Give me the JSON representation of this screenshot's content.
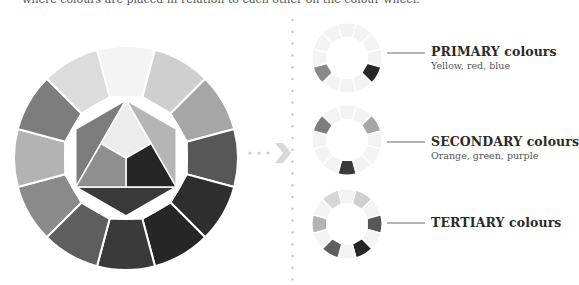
{
  "intro_text": "where colours are placed in relation to each other on the colour wheel.",
  "big_wheel": {
    "center": [
      126,
      158
    ],
    "outer_radius": 112,
    "inner_radius": 63,
    "segments": [
      {
        "position": "top",
        "color": "#f4f4f4"
      },
      {
        "position": "top-right",
        "color": "#cfcfcf"
      },
      {
        "position": "right-upper",
        "color": "#a6a6a6"
      },
      {
        "position": "right",
        "color": "#575757"
      },
      {
        "position": "right-lower",
        "color": "#2e2e2e"
      },
      {
        "position": "bottom-right",
        "color": "#262626"
      },
      {
        "position": "bottom",
        "color": "#3a3a3a"
      },
      {
        "position": "bottom-left",
        "color": "#5e5e5e"
      },
      {
        "position": "left-lower",
        "color": "#8a8a8a"
      },
      {
        "position": "left",
        "color": "#b3b3b3"
      },
      {
        "position": "left-upper",
        "color": "#7d7d7d"
      },
      {
        "position": "top-left",
        "color": "#dcdcdc"
      }
    ],
    "hexagon": {
      "radius": 58,
      "center_triangle_yellow": "#ececec",
      "primary_red": "#8f8f8f",
      "primary_blue": "#262626",
      "secondary_orange": "#b5b5b5",
      "secondary_green": "#7d7d7d",
      "secondary_purple": "#3a3a3a"
    }
  },
  "arrow": {
    "color": "#d8d8d8",
    "dots_color": "#cccccc"
  },
  "separator": {
    "color": "#cccccc"
  },
  "small_wheels": [
    {
      "id": "primary",
      "center": [
        347,
        58
      ],
      "title": "PRIMARY colours",
      "subtitle": "Yellow, red, blue",
      "line_y": 53,
      "highlight": [
        {
          "index": 0,
          "color": "#f2f2f2"
        },
        {
          "index": 4,
          "color": "#262626"
        },
        {
          "index": 8,
          "color": "#8a8a8a"
        }
      ]
    },
    {
      "id": "secondary",
      "center": [
        347,
        140
      ],
      "title": "SECONDARY colours",
      "subtitle": "Orange, green, purple",
      "line_y": 142,
      "highlight": [
        {
          "index": 2,
          "color": "#a6a6a6"
        },
        {
          "index": 6,
          "color": "#3a3a3a"
        },
        {
          "index": 10,
          "color": "#7d7d7d"
        }
      ]
    },
    {
      "id": "tertiary",
      "center": [
        347,
        224
      ],
      "title": "TERTIARY colours",
      "subtitle": "",
      "line_y": 223,
      "highlight": [
        {
          "index": 1,
          "color": "#cfcfcf"
        },
        {
          "index": 3,
          "color": "#575757"
        },
        {
          "index": 5,
          "color": "#262626"
        },
        {
          "index": 7,
          "color": "#5e5e5e"
        },
        {
          "index": 9,
          "color": "#b3b3b3"
        },
        {
          "index": 11,
          "color": "#d6d6d6"
        }
      ]
    }
  ],
  "small_wheel_base_color": "#f3f3f3"
}
